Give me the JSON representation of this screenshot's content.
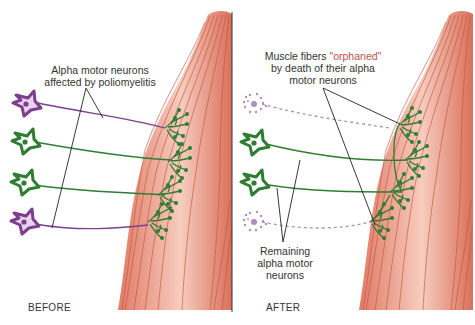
{
  "before": {
    "caption": "BEFORE",
    "label_line1": "Alpha motor neurons",
    "label_line2": "affected by poliomyelitis"
  },
  "after": {
    "caption": "AFTER",
    "orphaned_line1_a": "Muscle fibers ",
    "orphaned_line1_b": "\"orphaned\"",
    "orphaned_line2": "by death of their alpha",
    "orphaned_line3": "motor neurons",
    "remaining_line1": "Remaining",
    "remaining_line2": "alpha motor",
    "remaining_line3": "neurons"
  },
  "colors": {
    "healthy_neuron": "#2e7d32",
    "affected_neuron": "#7b3f8c",
    "dead_neuron": "#a98fc4",
    "muscle": "#e58a78",
    "muscle_light": "#f6c9bb",
    "muscle_fiber": "#c95a45"
  }
}
